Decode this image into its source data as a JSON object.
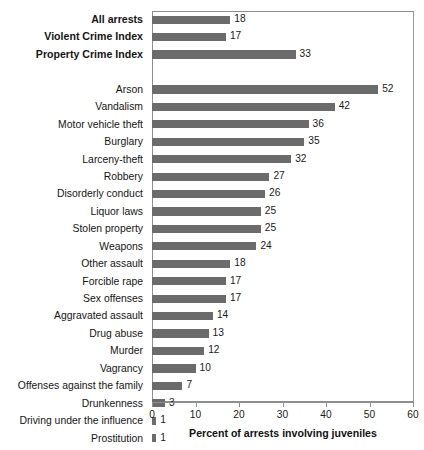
{
  "chart_data": {
    "type": "bar",
    "orientation": "horizontal",
    "title": "",
    "xlabel": "Percent of arrests involving juveniles",
    "ylabel": "",
    "xlim": [
      0,
      60
    ],
    "xticks": [
      0,
      10,
      20,
      30,
      40,
      50,
      60
    ],
    "grid": false,
    "legend": null,
    "bar_color": "#6b6b6b",
    "frame_color": "#8e8e8e",
    "categories": [
      "All arrests",
      "Violent Crime Index",
      "Property Crime Index",
      "Arson",
      "Vandalism",
      "Motor vehicle theft",
      "Burglary",
      "Larceny-theft",
      "Robbery",
      "Disorderly conduct",
      "Liquor laws",
      "Stolen property",
      "Weapons",
      "Other assault",
      "Forcible rape",
      "Sex offenses",
      "Aggravated assault",
      "Drug abuse",
      "Murder",
      "Vagrancy",
      "Offenses against the family",
      "Drunkenness",
      "Driving under the influence",
      "Prostitution"
    ],
    "values": [
      18,
      17,
      33,
      52,
      42,
      36,
      35,
      32,
      27,
      26,
      25,
      25,
      24,
      18,
      17,
      17,
      14,
      13,
      12,
      10,
      7,
      3,
      1,
      1
    ],
    "rows": [
      {
        "label": "All arrests",
        "value": 18,
        "bold": true,
        "spacer_after": false
      },
      {
        "label": "Violent Crime Index",
        "value": 17,
        "bold": true,
        "spacer_after": false
      },
      {
        "label": "Property Crime Index",
        "value": 33,
        "bold": true,
        "spacer_after": true
      },
      {
        "label": "Arson",
        "value": 52,
        "bold": false,
        "spacer_after": false
      },
      {
        "label": "Vandalism",
        "value": 42,
        "bold": false,
        "spacer_after": false
      },
      {
        "label": "Motor vehicle theft",
        "value": 36,
        "bold": false,
        "spacer_after": false
      },
      {
        "label": "Burglary",
        "value": 35,
        "bold": false,
        "spacer_after": false
      },
      {
        "label": "Larceny-theft",
        "value": 32,
        "bold": false,
        "spacer_after": false
      },
      {
        "label": "Robbery",
        "value": 27,
        "bold": false,
        "spacer_after": false
      },
      {
        "label": "Disorderly conduct",
        "value": 26,
        "bold": false,
        "spacer_after": false
      },
      {
        "label": "Liquor laws",
        "value": 25,
        "bold": false,
        "spacer_after": false
      },
      {
        "label": "Stolen property",
        "value": 25,
        "bold": false,
        "spacer_after": false
      },
      {
        "label": "Weapons",
        "value": 24,
        "bold": false,
        "spacer_after": false
      },
      {
        "label": "Other assault",
        "value": 18,
        "bold": false,
        "spacer_after": false
      },
      {
        "label": "Forcible rape",
        "value": 17,
        "bold": false,
        "spacer_after": false
      },
      {
        "label": "Sex offenses",
        "value": 17,
        "bold": false,
        "spacer_after": false
      },
      {
        "label": "Aggravated assault",
        "value": 14,
        "bold": false,
        "spacer_after": false
      },
      {
        "label": "Drug abuse",
        "value": 13,
        "bold": false,
        "spacer_after": false
      },
      {
        "label": "Murder",
        "value": 12,
        "bold": false,
        "spacer_after": false
      },
      {
        "label": "Vagrancy",
        "value": 10,
        "bold": false,
        "spacer_after": false
      },
      {
        "label": "Offenses against the family",
        "value": 7,
        "bold": false,
        "spacer_after": false
      },
      {
        "label": "Drunkenness",
        "value": 3,
        "bold": false,
        "spacer_after": false
      },
      {
        "label": "Driving under the influence",
        "value": 1,
        "bold": false,
        "spacer_after": false
      },
      {
        "label": "Prostitution",
        "value": 1,
        "bold": false,
        "spacer_after": false
      }
    ]
  }
}
